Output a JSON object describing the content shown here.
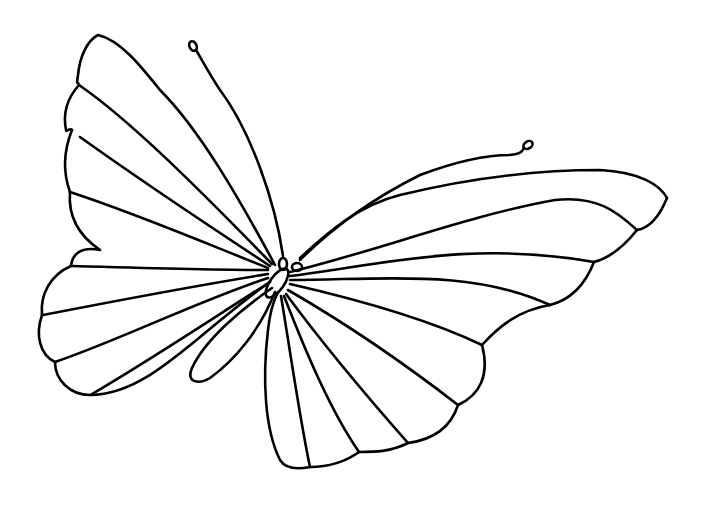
{
  "illustration": {
    "title": "Butterfly line drawing",
    "subject": "butterfly",
    "style": "black outline coloring page",
    "background_color": "#ffffff",
    "line_color": "#000000",
    "parts": [
      "upper-left-wing",
      "lower-left-wing",
      "left-tail-lobe",
      "upper-right-wing",
      "lower-right-wing",
      "body",
      "head",
      "eyes",
      "left-antenna",
      "right-antenna"
    ]
  }
}
